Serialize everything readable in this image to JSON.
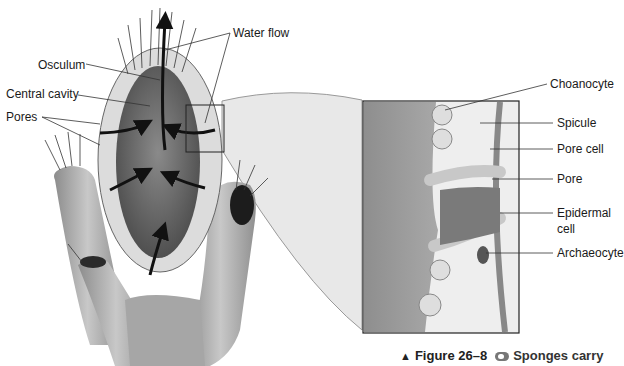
{
  "labels": {
    "osculum": "Osculum",
    "central_cavity": "Central cavity",
    "pores": "Pores",
    "water_flow": "Water flow",
    "choanocyte": "Choanocyte",
    "spicule": "Spicule",
    "pore_cell": "Pore cell",
    "pore": "Pore",
    "epidermal_cell_line1": "Epidermal",
    "epidermal_cell_line2": "cell",
    "archaeocyte": "Archaeocyte"
  },
  "caption": {
    "marker": "▲",
    "figure": "Figure 26–8",
    "icon": "go-online-icon",
    "text": "Sponges carry"
  },
  "colors": {
    "background": "#ffffff",
    "ink": "#1a1a1a",
    "cavity": "#6e6e6e",
    "body": "#b5b5b5",
    "wall": "#e2e2e2",
    "inset_bg": "#9a9a9a",
    "callout": "#e6e6e6"
  }
}
